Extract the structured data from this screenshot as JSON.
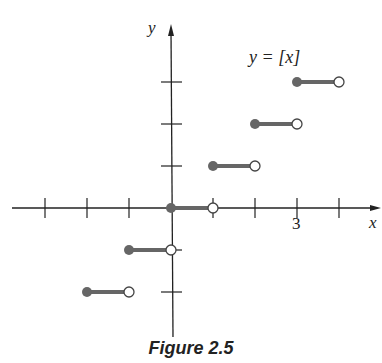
{
  "chart_data": {
    "type": "line",
    "title": "y = [x]",
    "function": "greatest integer (floor) function",
    "xlabel": "x",
    "ylabel": "y",
    "xlim": [
      -3.2,
      4.3
    ],
    "ylim": [
      -2.9,
      3.6
    ],
    "x_tick_labels": [
      {
        "value": 3,
        "label": "3"
      }
    ],
    "x_ticks": [
      -3,
      -2,
      -1,
      0,
      1,
      2,
      3,
      4
    ],
    "y_ticks": [
      -2,
      -1,
      1,
      2,
      3
    ],
    "grid": false,
    "segments": [
      {
        "x_start": -2,
        "x_end": -1,
        "y": -2,
        "start": "closed",
        "end": "open"
      },
      {
        "x_start": -1,
        "x_end": 0,
        "y": -1,
        "start": "closed",
        "end": "open"
      },
      {
        "x_start": 0,
        "x_end": 1,
        "y": 0,
        "start": "closed",
        "end": "open"
      },
      {
        "x_start": 1,
        "x_end": 2,
        "y": 1,
        "start": "closed",
        "end": "open"
      },
      {
        "x_start": 2,
        "x_end": 3,
        "y": 2,
        "start": "closed",
        "end": "open"
      },
      {
        "x_start": 3,
        "x_end": 4,
        "y": 3,
        "start": "closed",
        "end": "open"
      }
    ],
    "colors": {
      "axis": "#222222",
      "segment": "#666666",
      "open_fill": "#ffffff"
    }
  },
  "labels": {
    "equation": "y = [x]",
    "x_axis": "x",
    "y_axis": "y",
    "tick_3": "3",
    "caption": "Figure 2.5"
  }
}
